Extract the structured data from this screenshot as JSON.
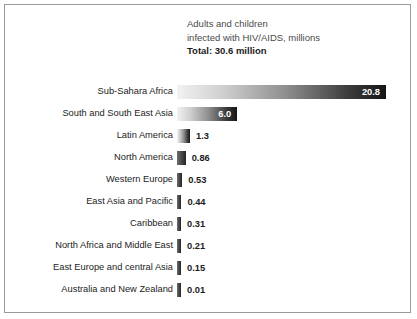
{
  "title": {
    "line1": "Adults and children",
    "line2": "infected with HIV/AIDS, millions",
    "line3": "Total: 30.6 million"
  },
  "chart_data": {
    "type": "bar",
    "orientation": "horizontal",
    "title": "Adults and children infected with HIV/AIDS, millions",
    "subtitle": "Total: 30.6 million",
    "xlabel": "",
    "ylabel": "",
    "xlim": [
      0,
      20.8
    ],
    "grid": false,
    "legend": false,
    "unit": "millions",
    "total": 30.6,
    "categories": [
      "Sub-Sahara Africa",
      "South and South East Asia",
      "Latin America",
      "North America",
      "Western Europe",
      "East Asia and Pacific",
      "Caribbean",
      "North Africa and Middle East",
      "East Europe and central Asia",
      "Australia and New Zealand"
    ],
    "values": [
      20.8,
      6.0,
      1.3,
      0.86,
      0.53,
      0.44,
      0.31,
      0.21,
      0.15,
      0.01
    ],
    "value_labels": [
      "20.8",
      "6.0",
      "1.3",
      "0.86",
      "0.53",
      "0.44",
      "0.31",
      "0.21",
      "0.15",
      "0.01"
    ],
    "label_placement": [
      "inside",
      "inside",
      "outside",
      "outside",
      "outside",
      "outside",
      "outside",
      "outside",
      "outside",
      "outside"
    ],
    "colors": {
      "bar_gradient_start": "#f2f2f2",
      "bar_gradient_end": "#151515",
      "label_inside": "#ffffff",
      "label_outside": "#1c1c1c",
      "frame": "#9a9a9a",
      "background": "#ffffff"
    }
  }
}
